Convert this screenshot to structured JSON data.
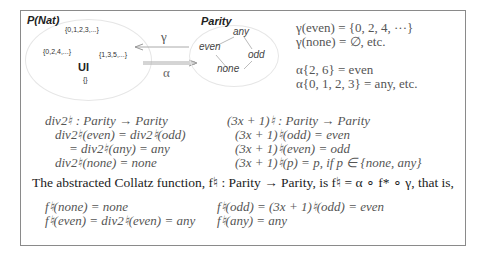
{
  "diagram": {
    "left_title": "P(Nat)",
    "left_sets": [
      "{0,1,2,3,...}",
      "{0,2,4,...}",
      "{1,3,5,...}",
      "UI",
      "{}"
    ],
    "gamma_symbol": "γ",
    "alpha_symbol": "α",
    "right_title": "Parity",
    "right_nodes": [
      "any",
      "even",
      "odd",
      "none"
    ]
  },
  "definitions": {
    "gamma_lines": [
      "γ(even) = {0, 2, 4, ···}",
      "γ(none) = ∅, etc."
    ],
    "alpha_lines": [
      "α{2, 6} = even",
      "α{0, 1, 2, 3} = any, etc."
    ]
  },
  "div2": {
    "lines": [
      "div2♮ : Parity → Parity",
      "div2♮(even) = div2♮(odd)",
      "= div2♮(any) = any",
      "div2♮(none) = none"
    ]
  },
  "threex": {
    "lines": [
      "(3x + 1)♮ : Parity → Parity",
      "(3x + 1)♮(odd) = even",
      "(3x + 1)♮(even) = odd",
      "(3x + 1)♮(p) = p, if p ∈ {none, any}"
    ]
  },
  "summary": {
    "sentence": "The abstracted Collatz function, f♮ : Parity → Parity, is f♮ = α ∘ f* ∘ γ, that is,"
  },
  "results": {
    "left": [
      "f♮(none) = none",
      "f♮(even) = div2♮(even) = any"
    ],
    "right": [
      "f♮(odd) = (3x + 1)♮(odd) = even",
      "f♮(any) = any"
    ]
  }
}
